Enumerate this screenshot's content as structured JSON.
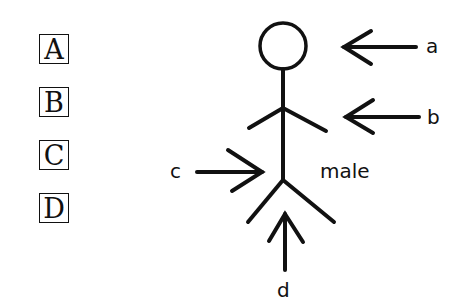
{
  "options": [
    {
      "id": "A",
      "label": "A",
      "top": 34
    },
    {
      "id": "B",
      "label": "B",
      "top": 87
    },
    {
      "id": "C",
      "label": "C",
      "top": 140
    },
    {
      "id": "D",
      "label": "D",
      "top": 193
    }
  ],
  "figure": {
    "caption": "male",
    "arrows": [
      {
        "label": "a",
        "points_to": "head"
      },
      {
        "label": "b",
        "points_to": "arms"
      },
      {
        "label": "c",
        "points_to": "body"
      },
      {
        "label": "d",
        "points_to": "legs"
      }
    ]
  },
  "colors": {
    "ink": "#111111",
    "background": "#ffffff"
  }
}
